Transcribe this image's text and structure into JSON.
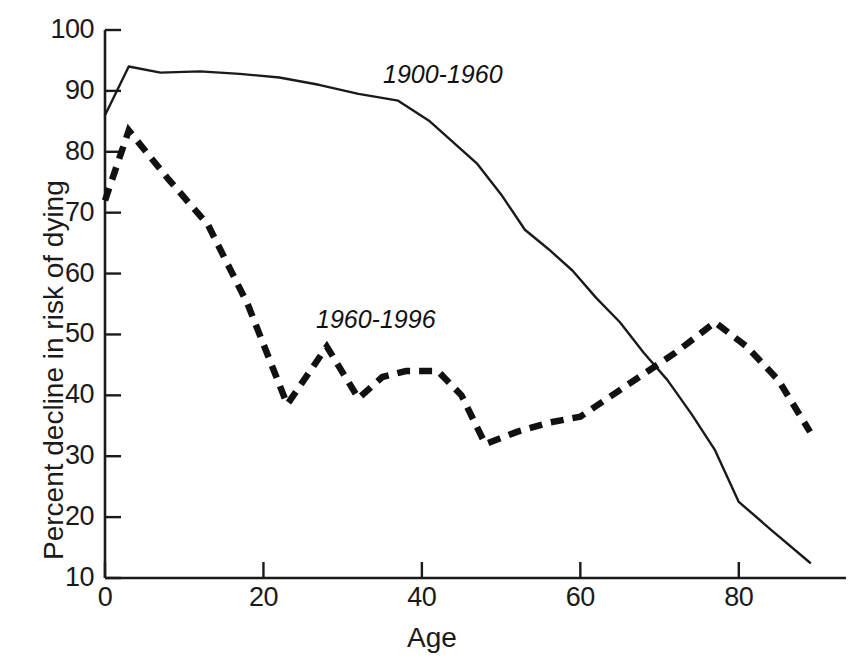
{
  "chart_data": {
    "type": "line",
    "title": "",
    "xlabel": "Age",
    "ylabel": "Percent decline in risk of dying",
    "xlim": [
      0,
      90
    ],
    "ylim": [
      10,
      100
    ],
    "xticks": [
      0,
      20,
      40,
      60,
      80
    ],
    "xtick_labels": [
      "0",
      "20",
      "40",
      "60",
      "80"
    ],
    "yticks": [
      10,
      20,
      30,
      40,
      50,
      60,
      70,
      80,
      90,
      100
    ],
    "ytick_labels": [
      "10",
      "20",
      "30",
      "40",
      "50",
      "60",
      "70",
      "80",
      "90",
      "100"
    ],
    "grid": false,
    "legend_position": "inline-annotation",
    "series": [
      {
        "name": "1900-1960",
        "style": "solid",
        "color": "#1a1a1a",
        "annotation_label": "1900-1960",
        "x": [
          0,
          3,
          7,
          12,
          17,
          22,
          27,
          32,
          37,
          41,
          44,
          47,
          50,
          53,
          56,
          59,
          62,
          65,
          68,
          71,
          74,
          77,
          80,
          84,
          89
        ],
        "y": [
          86.0,
          94.0,
          93.0,
          93.2,
          92.8,
          92.2,
          91.0,
          89.5,
          88.4,
          85.0,
          81.5,
          78.0,
          73.0,
          67.2,
          64.0,
          60.5,
          56.0,
          52.0,
          47.0,
          42.5,
          37.0,
          31.0,
          22.5,
          18.0,
          12.5
        ]
      },
      {
        "name": "1960-1996",
        "style": "dashed",
        "color": "#111111",
        "annotation_label": "1960-1996",
        "x": [
          0,
          3,
          8,
          13,
          18,
          23,
          28,
          32,
          35,
          38,
          42,
          45,
          48,
          52,
          56,
          60,
          64,
          68,
          72,
          77,
          81,
          85,
          89
        ],
        "y": [
          72.0,
          83.5,
          75.5,
          68.0,
          55.0,
          38.5,
          48.0,
          39.5,
          43.0,
          44.0,
          44.0,
          40.0,
          32.0,
          34.0,
          35.5,
          36.5,
          40.0,
          43.5,
          47.0,
          52.0,
          48.0,
          42.5,
          34.0
        ]
      }
    ]
  },
  "annotations": {
    "series1": {
      "label": "1900-1960",
      "x_px": 383,
      "y_px": 60
    },
    "series2": {
      "label": "1960-1996",
      "x_px": 316,
      "y_px": 305
    }
  },
  "axis": {
    "x_title": "Age",
    "y_title": "Percent decline in risk of dying"
  }
}
